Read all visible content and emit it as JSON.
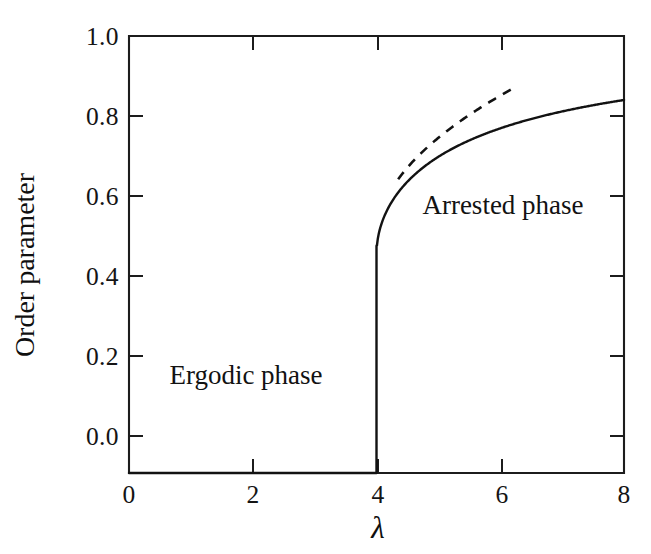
{
  "figure": {
    "background_color": "#ffffff",
    "ink_color": "#121212",
    "ylabel": "Order parameter",
    "xlabel": "λ",
    "annotations": [
      {
        "text": "Ergodic phase",
        "x": 1.9,
        "y": 0.13
      },
      {
        "text": "Arrested phase",
        "x": 6.05,
        "y": 0.585
      }
    ]
  },
  "chart_data": {
    "type": "line",
    "title": "",
    "subtitle": "",
    "xlabel": "λ",
    "ylabel": "Order parameter",
    "xlim": [
      0,
      8
    ],
    "ylim": [
      0.0,
      1.0
    ],
    "xticks": [
      0,
      2,
      4,
      6,
      8
    ],
    "xtick_labels": [
      "0",
      "2",
      "4",
      "6",
      "8"
    ],
    "yticks": [
      0.0,
      0.2,
      0.4,
      0.6,
      0.8,
      1.0
    ],
    "ytick_labels": [
      "0.0",
      "0.2",
      "0.4",
      "0.6",
      "0.8",
      "1.0"
    ],
    "grid": false,
    "legend": null,
    "legend_position": "none",
    "transition_point": {
      "lambda_c": 4.0,
      "jump_from": 0.0,
      "jump_to": 0.52
    },
    "series": [
      {
        "name": "order parameter",
        "style": "solid",
        "x": [
          0.0,
          0.5,
          1.0,
          1.5,
          2.0,
          2.5,
          3.0,
          3.5,
          3.9,
          4.0,
          4.0,
          4.02,
          4.05,
          4.1,
          4.2,
          4.3,
          4.4,
          4.5,
          4.6,
          4.8,
          5.0,
          5.25,
          5.5,
          5.75,
          6.0,
          6.25,
          6.5,
          6.75,
          7.0,
          7.25,
          7.5,
          7.75,
          8.0
        ],
        "y": [
          0.0,
          0.0,
          0.0,
          0.0,
          0.0,
          0.0,
          0.0,
          0.0,
          0.0,
          0.0,
          0.524,
          0.571,
          0.611,
          0.656,
          0.718,
          0.762,
          0.796,
          0.822,
          0.0,
          0.0,
          0.724,
          0.0,
          0.0,
          0.0,
          0.789,
          0.0,
          0.0,
          0.0,
          0.827,
          0.0,
          0.0,
          0.0,
          0.854
        ],
        "formula": "0.5*(1+sqrt(1-4/lambda)) for lambda>=4, 0 for lambda<4",
        "endpoint_value": 0.854
      },
      {
        "name": "asymptotic square-root law",
        "style": "dashed",
        "x": [
          4.35,
          4.6,
          5.0,
          5.4,
          5.8,
          6.27
        ],
        "y": [
          0.672,
          0.712,
          0.766,
          0.81,
          0.846,
          0.885
        ],
        "x_start": 4.35,
        "x_end": 6.27,
        "y_start": 0.672,
        "y_end": 0.885
      }
    ]
  }
}
